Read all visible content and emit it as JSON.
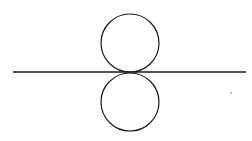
{
  "figure": {
    "width": 252,
    "height": 141,
    "background": "#ffffff",
    "stroke_color": "#1a1a1a",
    "baseline": {
      "x1": 13,
      "y1": 72,
      "x2": 246,
      "y2": 72,
      "stroke_width": 1.3
    },
    "circles": [
      {
        "name": "top-circle",
        "cx": 130,
        "cy": 43,
        "r": 29,
        "stroke_width": 1.2
      },
      {
        "name": "bottom-circle",
        "cx": 130,
        "cy": 102,
        "r": 29,
        "stroke_width": 1.2
      }
    ],
    "marks": [
      {
        "name": "small-dot",
        "cx": 231,
        "cy": 93,
        "r": 0.7,
        "fill": "#555555"
      }
    ]
  }
}
